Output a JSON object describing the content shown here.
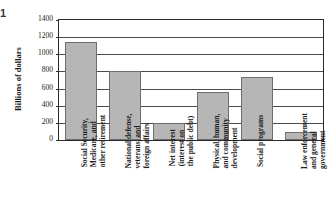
{
  "figure": {
    "number": "1",
    "y_axis_title": "Billions of dollars"
  },
  "chart_data": {
    "type": "bar",
    "title": "",
    "xlabel": "",
    "ylabel": "Billions of dollars",
    "ylim": [
      0,
      1400
    ],
    "ytick_values": [
      0,
      200,
      400,
      600,
      800,
      1000,
      1200,
      1400
    ],
    "ytick_labels": [
      "0",
      "200",
      "400",
      "600",
      "800",
      "1000",
      "1200",
      "1400"
    ],
    "grid": true,
    "legend": "none",
    "bar_color": "#b6b6b6",
    "bar_edge_color": "#6e6e6e",
    "axis_color": "#2b2b2b",
    "categories": [
      "Social Security, Medicare, and other retirement",
      "National defense, veterans, and foreign affairs",
      "Net interest (interest on the public debt)",
      "Physical, human, and community development",
      "Social programs",
      "Law enforcement and general government"
    ],
    "category_lines": [
      [
        "Social Security,",
        "Medicare, and",
        "other retirement"
      ],
      [
        "National defense,",
        "veterans, and",
        "foreign affairs"
      ],
      [
        "Net interest",
        "(interest on",
        "the public debt)"
      ],
      [
        "Physical, human,",
        "and community",
        "development"
      ],
      [
        "Social programs"
      ],
      [
        "Law enforcement",
        "and general",
        "government"
      ]
    ],
    "values": [
      1140,
      800,
      200,
      555,
      735,
      90
    ]
  }
}
